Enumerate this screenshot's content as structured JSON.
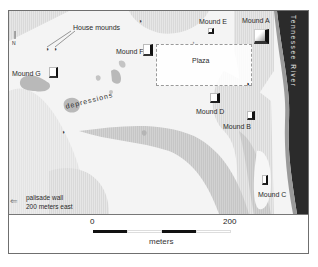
{
  "map": {
    "north_label": "N",
    "annotations": {
      "house_mounds": "House mounds",
      "depressions": "depressions",
      "plaza": "Plaza",
      "river": "Tennessee River",
      "palisade_line1": "palisade wall",
      "palisade_line2": "200 meters east"
    },
    "mounds": [
      {
        "id": "A",
        "label": "Mound A"
      },
      {
        "id": "B",
        "label": "Mound B"
      },
      {
        "id": "C",
        "label": "Mound C"
      },
      {
        "id": "D",
        "label": "Mound D"
      },
      {
        "id": "E",
        "label": "Mound E"
      },
      {
        "id": "F",
        "label": "Mound F"
      },
      {
        "id": "G",
        "label": "Mound G"
      }
    ],
    "colors": {
      "river": "#2b2b2b",
      "terrain_light": "#f3f3f3",
      "terrain_mid": "#e2e2e2",
      "terrain_dark": "#cfcfcf",
      "depression": "#b9b9b9"
    }
  },
  "scale_bar": {
    "start_label": "0",
    "end_label": "200",
    "unit": "meters"
  }
}
